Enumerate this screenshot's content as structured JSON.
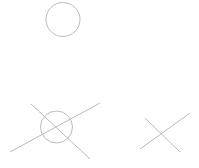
{
  "canvas": {
    "width": 199,
    "height": 168,
    "background": "#ffffff"
  },
  "stroke": {
    "color": "#bbbbbb",
    "width": 1
  },
  "shapes": [
    {
      "id": "circle-top",
      "type": "circle",
      "cx": 63,
      "cy": 19.5,
      "r": 17
    },
    {
      "id": "circle-crossed",
      "type": "circle",
      "cx": 56.5,
      "cy": 127,
      "r": 16
    },
    {
      "id": "line-crossed-a",
      "type": "line",
      "x1": 10,
      "y1": 152,
      "x2": 100,
      "y2": 103
    },
    {
      "id": "line-crossed-b",
      "type": "line",
      "x1": 31,
      "y1": 104,
      "x2": 90,
      "y2": 159
    },
    {
      "id": "line-x-a",
      "type": "line",
      "x1": 145,
      "y1": 118,
      "x2": 180,
      "y2": 152
    },
    {
      "id": "line-x-b",
      "type": "line",
      "x1": 140,
      "y1": 149,
      "x2": 190,
      "y2": 113
    }
  ]
}
